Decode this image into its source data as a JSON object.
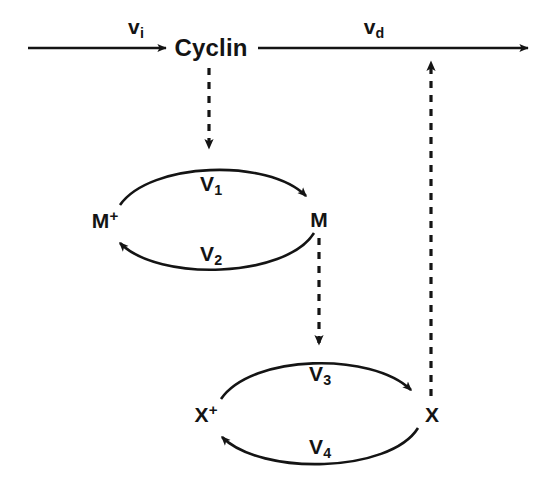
{
  "diagram": {
    "type": "biochemical-pathway",
    "colors": {
      "ink": "#141414",
      "background": "#ffffff"
    },
    "nodes": {
      "cyclin": {
        "label": "Cyclin",
        "x": 211,
        "y": 48
      },
      "m_inactive": {
        "label": "M",
        "superscript": "+",
        "x": 105,
        "y": 220
      },
      "m_active": {
        "label": "M",
        "superscript": "",
        "x": 319,
        "y": 219
      },
      "x_inactive": {
        "label": "X",
        "superscript": "+",
        "x": 206,
        "y": 414
      },
      "x_active": {
        "label": "X",
        "superscript": "",
        "x": 432,
        "y": 414
      }
    },
    "rates": {
      "vi": {
        "base": "v",
        "subscript": "i",
        "x": 136,
        "y": 28,
        "description": "cyclin synthesis rate"
      },
      "vd": {
        "base": "v",
        "subscript": "d",
        "x": 374,
        "y": 28,
        "description": "cyclin degradation rate"
      },
      "v1": {
        "base": "V",
        "subscript": "1",
        "x": 211,
        "y": 185,
        "description": "M activation"
      },
      "v2": {
        "base": "V",
        "subscript": "2",
        "x": 211,
        "y": 255,
        "description": "M inactivation"
      },
      "v3": {
        "base": "V",
        "subscript": "3",
        "x": 320,
        "y": 375,
        "description": "X activation"
      },
      "v4": {
        "base": "V",
        "subscript": "4",
        "x": 320,
        "y": 448,
        "description": "X inactivation"
      }
    },
    "edges": [
      {
        "name": "synthesis-arrow",
        "from": "source",
        "to": "cyclin",
        "style": "solid"
      },
      {
        "name": "degradation-arrow",
        "from": "cyclin",
        "to": "sink",
        "style": "solid"
      },
      {
        "name": "cyclin-activates-m",
        "from": "cyclin",
        "to": "m-cycle",
        "style": "dashed"
      },
      {
        "name": "m-activates-x",
        "from": "m_active",
        "to": "x-cycle",
        "style": "dashed"
      },
      {
        "name": "x-drives-degradation",
        "from": "x_active",
        "to": "degradation-arrow",
        "style": "dashed"
      },
      {
        "name": "m-activation-curve",
        "from": "m_inactive",
        "to": "m_active",
        "style": "curved-solid"
      },
      {
        "name": "m-inactivation-curve",
        "from": "m_active",
        "to": "m_inactive",
        "style": "curved-solid"
      },
      {
        "name": "x-activation-curve",
        "from": "x_inactive",
        "to": "x_active",
        "style": "curved-solid"
      },
      {
        "name": "x-inactivation-curve",
        "from": "x_active",
        "to": "x_inactive",
        "style": "curved-solid"
      }
    ]
  }
}
